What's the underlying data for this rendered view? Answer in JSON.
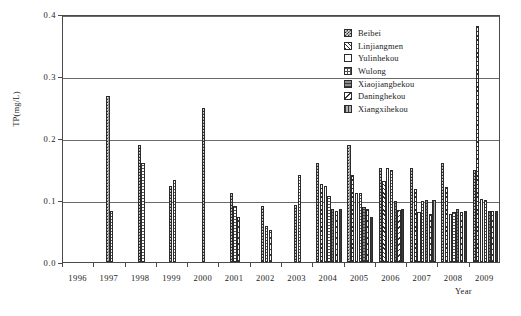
{
  "chart_data": {
    "type": "bar",
    "title": "",
    "xlabel": "Year",
    "ylabel": "TP(mg/L)",
    "ylim": [
      0.0,
      0.4
    ],
    "yticks": [
      "0.0",
      "0.1",
      "0.2",
      "0.3",
      "0.4"
    ],
    "ytick_values": [
      0.0,
      0.1,
      0.2,
      0.3,
      0.4
    ],
    "grid": "horizontal",
    "legend_position": "top-right",
    "categories": [
      "1996",
      "1997",
      "1998",
      "1999",
      "2000",
      "2001",
      "2002",
      "2003",
      "2004",
      "2005",
      "2006",
      "2007",
      "2008",
      "2009"
    ],
    "series": [
      {
        "name": "Beibei",
        "pattern": "checker-dark",
        "values": [
          null,
          0.268,
          0.188,
          0.123,
          0.248,
          0.112,
          0.09,
          0.092,
          0.16,
          0.188,
          0.152,
          0.152,
          0.16,
          0.148
        ]
      },
      {
        "name": "Linjiangmen",
        "pattern": "diagonal-hatch",
        "values": [
          null,
          null,
          null,
          null,
          null,
          null,
          null,
          null,
          0.126,
          0.141,
          0.13,
          0.118,
          0.121,
          0.38
        ]
      },
      {
        "name": "Yulinhekou",
        "pattern": "solid-white",
        "values": [
          null,
          null,
          null,
          null,
          null,
          null,
          null,
          null,
          0.123,
          0.112,
          0.151,
          0.08,
          0.078,
          0.101
        ]
      },
      {
        "name": "Wulong",
        "pattern": "grid-mesh",
        "values": [
          null,
          0.082,
          0.16,
          0.132,
          null,
          0.09,
          0.058,
          0.141,
          0.106,
          0.112,
          0.148,
          0.098,
          0.08,
          0.1
        ]
      },
      {
        "name": "Xiaojiangbekou",
        "pattern": "horizontal-gray",
        "values": [
          null,
          null,
          null,
          null,
          null,
          null,
          null,
          null,
          0.086,
          0.088,
          0.099,
          0.1,
          0.085,
          0.082
        ]
      },
      {
        "name": "Daninghekou",
        "pattern": "back-diagonal-hatch",
        "values": [
          null,
          null,
          null,
          null,
          null,
          0.072,
          0.052,
          null,
          0.082,
          0.085,
          0.084,
          0.078,
          0.08,
          0.083
        ]
      },
      {
        "name": "Xiangxihekou",
        "pattern": "vertical-gray",
        "values": [
          null,
          null,
          null,
          null,
          null,
          null,
          null,
          null,
          0.085,
          0.072,
          0.086,
          0.1,
          0.083,
          0.083
        ]
      }
    ]
  },
  "legend": {
    "items": [
      {
        "label": "Beibei"
      },
      {
        "label": "Linjiangmen"
      },
      {
        "label": "Yulinhekou"
      },
      {
        "label": "Wulong"
      },
      {
        "label": "Xiaojiangbekou"
      },
      {
        "label": "Daninghekou"
      },
      {
        "label": "Xiangxihekou"
      }
    ]
  }
}
